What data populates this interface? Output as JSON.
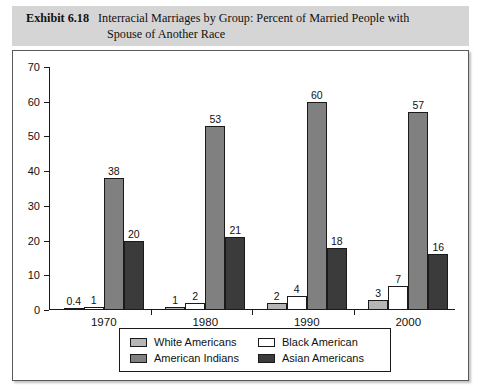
{
  "header": {
    "exhibit_label": "Exhibit 6.18",
    "title_line1": "Interracial Marriages by Group: Percent of Married People with",
    "title_line2": "Spouse of Another Race"
  },
  "chart_data": {
    "type": "bar",
    "title": "Interracial Marriages by Group: Percent of Married People with Spouse of Another Race",
    "xlabel": "",
    "ylabel": "",
    "ylim": [
      0,
      70
    ],
    "yticks": [
      0,
      10,
      20,
      30,
      40,
      50,
      60,
      70
    ],
    "grid": false,
    "legend_position": "bottom",
    "categories": [
      "1970",
      "1980",
      "1990",
      "2000"
    ],
    "series": [
      {
        "name": "White Americans",
        "color": "#b6b6b6",
        "values": [
          0.4,
          1,
          2,
          3
        ],
        "labels": [
          "0.4",
          "1",
          "2",
          "3"
        ]
      },
      {
        "name": "Black American",
        "color": "#ffffff",
        "values": [
          1,
          2,
          4,
          7
        ],
        "labels": [
          "1",
          "2",
          "4",
          "7"
        ]
      },
      {
        "name": "American Indians",
        "color": "#808080",
        "values": [
          38,
          53,
          60,
          57
        ],
        "labels": [
          "38",
          "53",
          "60",
          "57"
        ]
      },
      {
        "name": "Asian Americans",
        "color": "#3b3b3b",
        "values": [
          20,
          21,
          18,
          16
        ],
        "labels": [
          "20",
          "21",
          "18",
          "16"
        ]
      }
    ]
  },
  "axis": {
    "y_tick_labels": [
      "0",
      "10",
      "20",
      "30",
      "40",
      "50",
      "60",
      "70"
    ]
  },
  "legend": {
    "items": [
      {
        "label": "White Americans",
        "color": "#b6b6b6"
      },
      {
        "label": "Black American",
        "color": "#ffffff"
      },
      {
        "label": "American Indians",
        "color": "#808080"
      },
      {
        "label": "Asian Americans",
        "color": "#3b3b3b"
      }
    ]
  }
}
